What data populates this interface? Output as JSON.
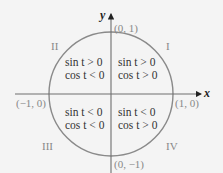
{
  "diagram": {
    "axes": {
      "x_label": "x",
      "y_label": "y"
    },
    "points": [
      {
        "id": "top",
        "label": "(0, 1)"
      },
      {
        "id": "bottom",
        "label": "(0, −1)"
      },
      {
        "id": "left",
        "label": "(−1, 0)"
      },
      {
        "id": "right",
        "label": "(1, 0)"
      }
    ],
    "quadrants": [
      {
        "numeral": "I",
        "sin": "sin t > 0",
        "cos": "cos t > 0"
      },
      {
        "numeral": "II",
        "sin": "sin t > 0",
        "cos": "cos t < 0"
      },
      {
        "numeral": "III",
        "sin": "sin t < 0",
        "cos": "cos t < 0"
      },
      {
        "numeral": "IV",
        "sin": "sin t < 0",
        "cos": "cos t > 0"
      }
    ],
    "colors": {
      "circle": "#8a8a8a",
      "axis": "#6e6e6e",
      "background": "#f4f4f4"
    }
  }
}
